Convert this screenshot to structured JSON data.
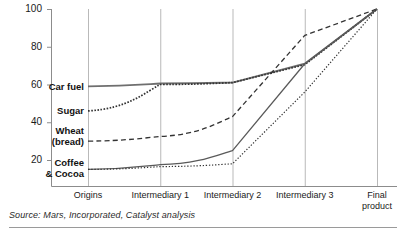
{
  "source_note": "Source: Mars, Incorporated, Catalyst analysis",
  "chart_data": {
    "type": "line",
    "title": "",
    "subtitle": "",
    "xlabel": "",
    "ylabel": "",
    "ylim": [
      10,
      100
    ],
    "xlim": [
      0,
      4
    ],
    "grid": "vertical-only",
    "legend": "inline-left-labels",
    "categories": [
      "Origins",
      "Intermediary 1",
      "Intermediary 2",
      "Intermediary 3",
      "Final product"
    ],
    "ytick_values": [
      20,
      40,
      60,
      80,
      100
    ],
    "ytick_labels": [
      "20",
      "40",
      "60",
      "80",
      "100"
    ],
    "xtick_labels": [
      "Origins",
      "Intermediary 1",
      "Intermediary 2",
      "Intermediary 3",
      "Final\nproduct"
    ],
    "series": [
      {
        "name": "Car fuel",
        "label": "Car fuel",
        "style": "solid",
        "color": "#6f6f6f",
        "width": 1.9,
        "values": [
          59,
          60.5,
          61,
          71,
          100
        ]
      },
      {
        "name": "Sugar",
        "label": "Sugar",
        "style": "dotted",
        "color": "#333333",
        "width": 1.7,
        "values": [
          46,
          60,
          61,
          70.5,
          100
        ]
      },
      {
        "name": "Wheat (bread)",
        "label": "Wheat\n(bread)",
        "style": "dashed",
        "color": "#333333",
        "width": 1.3,
        "values": [
          30,
          32.5,
          43,
          86,
          100
        ]
      },
      {
        "name": "Coffee & Cocoa",
        "label": "Coffee\n& Cocoa",
        "style": "solid",
        "color": "#5a5a5a",
        "width": 1.3,
        "values": [
          15,
          17.5,
          25,
          71,
          100
        ]
      },
      {
        "name": "Coffee & Cocoa (lower)",
        "label": "",
        "style": "fine-dotted",
        "color": "#333333",
        "width": 1.2,
        "values": [
          15,
          16.5,
          18,
          56,
          100
        ]
      }
    ],
    "series_label_positions": [
      {
        "label": "Car fuel",
        "x": 84,
        "y": 82
      },
      {
        "label": "Sugar",
        "x": 84,
        "y": 106
      },
      {
        "label": "Wheat\n(bread)",
        "x": 84,
        "y": 126
      },
      {
        "label": "Coffee\n& Cocoa",
        "x": 84,
        "y": 158
      }
    ]
  }
}
